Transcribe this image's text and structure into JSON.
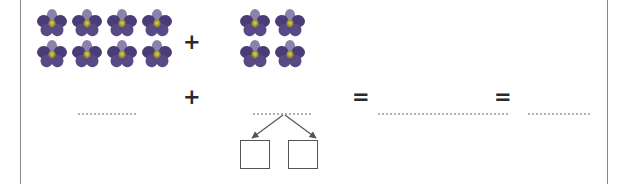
{
  "worksheet": {
    "title": "Addition with decomposition worksheet",
    "type": "math-exercise"
  },
  "equation": {
    "top_row": {
      "left_group": {
        "icon": "flower-icon",
        "count": 8,
        "columns": 4,
        "rows": 2,
        "label": "8 flowers"
      },
      "operator": "+",
      "right_group": {
        "icon": "flower-icon",
        "count": 4,
        "columns": 2,
        "rows": 2,
        "label": "4 flowers"
      }
    },
    "bottom_row": {
      "blank_1": "",
      "operator_1": "+",
      "blank_2": "",
      "operator_2": "=",
      "blank_3": "",
      "operator_3": "=",
      "blank_4": ""
    },
    "decomposition": {
      "box_1": "",
      "box_2": "",
      "arrow_left": "arrow-down-left-icon",
      "arrow_right": "arrow-down-right-icon"
    }
  },
  "colors": {
    "petal_dark": "#4a3d77",
    "petal_mid": "#574a85",
    "petal_light": "#8c82ab",
    "flower_center": "#9a9327",
    "flower_center_inner": "#c9c24a",
    "rule": "#888888",
    "blank": "#b3b3b3",
    "box_border": "#555555",
    "operator": "#2a2a2a",
    "background": "#ffffff"
  }
}
